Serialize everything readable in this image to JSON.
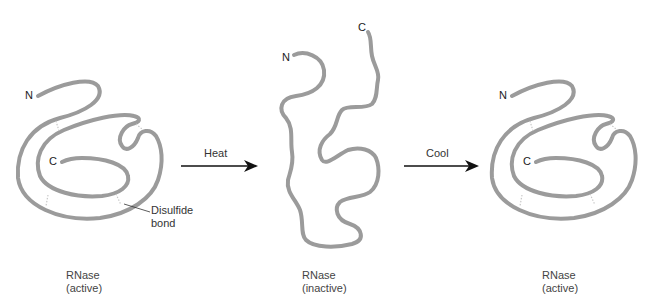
{
  "figure": {
    "molecules": [
      {
        "id": "native-left",
        "state_label_line1": "RNase",
        "state_label_line2": "(active)",
        "n_terminus": "N",
        "c_terminus": "C"
      },
      {
        "id": "denatured-middle",
        "state_label_line1": "RNase",
        "state_label_line2": "(inactive)",
        "n_terminus": "N",
        "c_terminus": "C"
      },
      {
        "id": "renatured-right",
        "state_label_line1": "RNase",
        "state_label_line2": "(active)",
        "n_terminus": "N",
        "c_terminus": "C"
      }
    ],
    "arrows": [
      {
        "label": "Heat"
      },
      {
        "label": "Cool"
      }
    ],
    "callout": {
      "line1": "Disulfide",
      "line2": "bond"
    },
    "colors": {
      "chain": "#9b9b9b",
      "disulfide": "#c8c8c8",
      "arrow": "#111111"
    }
  }
}
